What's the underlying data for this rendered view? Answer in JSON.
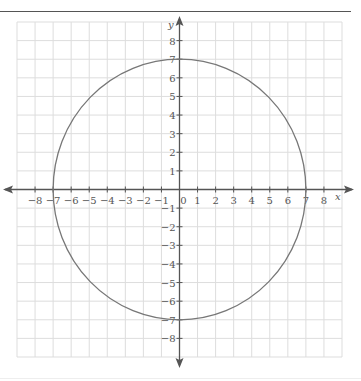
{
  "chart_data": {
    "type": "line",
    "title": "",
    "xlabel": "x",
    "ylabel": "y",
    "xlim": [
      -9,
      9
    ],
    "ylim": [
      -9,
      9
    ],
    "grid": true,
    "x_ticks": [
      -8,
      -7,
      -6,
      -5,
      -4,
      -3,
      -2,
      -1,
      0,
      1,
      2,
      3,
      4,
      5,
      6,
      7,
      8
    ],
    "y_ticks": [
      -8,
      -7,
      -6,
      -5,
      -4,
      -3,
      -2,
      -1,
      1,
      2,
      3,
      4,
      5,
      6,
      7,
      8
    ],
    "series": [
      {
        "name": "circle",
        "shape": "circle",
        "center": [
          0,
          0
        ],
        "radius": 7,
        "color": "#777777"
      }
    ]
  },
  "colors": {
    "grid": "#dddddd",
    "axis": "#555555",
    "curve": "#777777"
  }
}
